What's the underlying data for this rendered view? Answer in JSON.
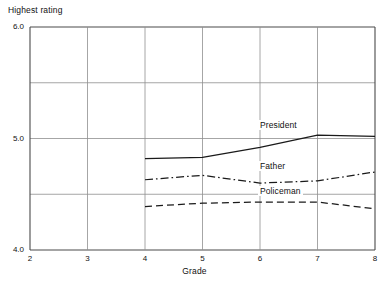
{
  "chart_data": {
    "type": "line",
    "title": "",
    "ylabel": "Highest rating",
    "xlabel": "Grade",
    "x": [
      4,
      5,
      6,
      7,
      8
    ],
    "xlim": [
      2,
      8
    ],
    "ylim": [
      4.0,
      6.0
    ],
    "grid": true,
    "legend_position": "inline-right-of-series",
    "xticks": [
      "2",
      "3",
      "4",
      "5",
      "6",
      "7",
      "8"
    ],
    "yticks": [
      "6.0",
      "5.0",
      "4.0"
    ],
    "ygridlines": [
      4.0,
      4.5,
      5.0,
      5.5,
      6.0
    ],
    "series": [
      {
        "name": "President",
        "style": "solid",
        "values": [
          4.82,
          4.83,
          4.92,
          5.03,
          5.02
        ]
      },
      {
        "name": "Father",
        "style": "dash-dot",
        "values": [
          4.63,
          4.67,
          4.6,
          4.62,
          4.7
        ]
      },
      {
        "name": "Policeman",
        "style": "dashed",
        "values": [
          4.39,
          4.42,
          4.43,
          4.43,
          4.37
        ]
      }
    ],
    "annotations": [
      {
        "text": "President",
        "x": 6.0,
        "y": 5.11
      },
      {
        "text": "Father",
        "x": 6.0,
        "y": 4.74
      },
      {
        "text": "Policeman",
        "x": 6.0,
        "y": 4.52
      }
    ]
  }
}
